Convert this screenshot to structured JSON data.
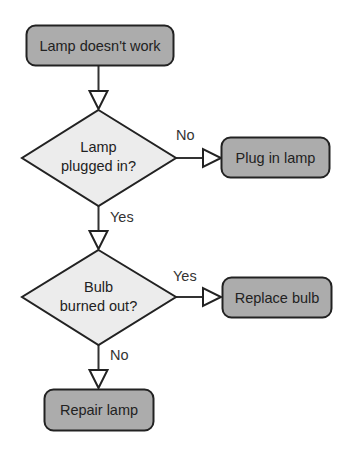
{
  "diagram": {
    "type": "flowchart",
    "colors": {
      "process_fill": "#acacac",
      "decision_fill": "#ececec",
      "stroke": "#222222",
      "arrowhead_fill": "#ffffff"
    },
    "nodes": {
      "start": {
        "shape": "rounded-rect",
        "label": "Lamp doesn't work"
      },
      "decision1": {
        "shape": "diamond",
        "line1": "Lamp",
        "line2": "plugged in?"
      },
      "plug_in": {
        "shape": "rounded-rect",
        "label": "Plug in lamp"
      },
      "decision2": {
        "shape": "diamond",
        "line1": "Bulb",
        "line2": "burned out?"
      },
      "replace": {
        "shape": "rounded-rect",
        "label": "Replace bulb"
      },
      "repair": {
        "shape": "rounded-rect",
        "label": "Repair lamp"
      }
    },
    "edges": [
      {
        "from": "start",
        "to": "decision1",
        "label": ""
      },
      {
        "from": "decision1",
        "to": "plug_in",
        "label": "No"
      },
      {
        "from": "decision1",
        "to": "decision2",
        "label": "Yes"
      },
      {
        "from": "decision2",
        "to": "replace",
        "label": "Yes"
      },
      {
        "from": "decision2",
        "to": "repair",
        "label": "No"
      }
    ]
  }
}
